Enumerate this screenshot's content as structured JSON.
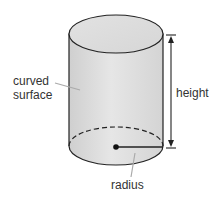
{
  "diagram": {
    "shape": "cylinder",
    "labels": {
      "curved_surface_line1": "curved",
      "curved_surface_line2": "surface",
      "height": "height",
      "radius": "radius"
    },
    "colors": {
      "outline": "#222222",
      "fill": "#d9d9d9",
      "fill_light": "#ececec",
      "pointer": "#aaaaaa",
      "text": "#333333"
    }
  }
}
